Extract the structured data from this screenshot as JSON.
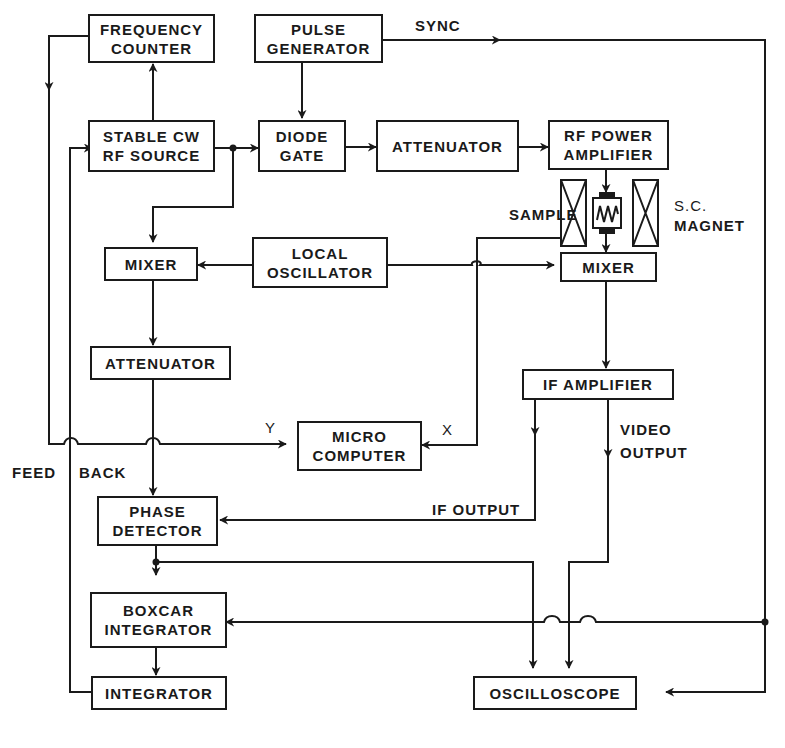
{
  "diagram": {
    "type": "block-diagram",
    "colors": {
      "ink": "#1a1a1a",
      "background": "#ffffff"
    },
    "blocks": {
      "frequency_counter": {
        "line1": "FREQUENCY",
        "line2": "COUNTER"
      },
      "pulse_generator": {
        "line1": "PULSE",
        "line2": "GENERATOR"
      },
      "stable_cw_rf_source": {
        "line1": "STABLE CW",
        "line2": "RF SOURCE"
      },
      "diode_gate": {
        "line1": "DIODE",
        "line2": "GATE"
      },
      "attenuator_top": {
        "line1": "ATTENUATOR"
      },
      "rf_power_amplifier": {
        "line1": "RF POWER",
        "line2": "AMPLIFIER"
      },
      "mixer_left": {
        "line1": "MIXER"
      },
      "local_oscillator": {
        "line1": "LOCAL",
        "line2": "OSCILLATOR"
      },
      "mixer_right": {
        "line1": "MIXER"
      },
      "attenuator_left": {
        "line1": "ATTENUATOR"
      },
      "if_amplifier": {
        "line1": "IF AMPLIFIER"
      },
      "micro_computer": {
        "line1": "MICRO",
        "line2": "COMPUTER"
      },
      "phase_detector": {
        "line1": "PHASE",
        "line2": "DETECTOR"
      },
      "boxcar_integrator": {
        "line1": "BOXCAR",
        "line2": "INTEGRATOR"
      },
      "integrator": {
        "line1": "INTEGRATOR"
      },
      "oscilloscope": {
        "line1": "OSCILLOSCOPE"
      }
    },
    "labels": {
      "sync": "SYNC",
      "sample": "SAMPLE",
      "sc_magnet_line1": "S.C.",
      "sc_magnet_line2": "MAGNET",
      "x": "X",
      "y": "Y",
      "video_output_line1": "VIDEO",
      "video_output_line2": "OUTPUT",
      "if_output": "IF OUTPUT",
      "feed": "FEED",
      "back": "BACK"
    },
    "connections": [
      {
        "from": "Pulse Generator",
        "to": "Diode Gate"
      },
      {
        "from": "Pulse Generator",
        "to": "Boxcar Integrator / Oscilloscope",
        "label": "SYNC"
      },
      {
        "from": "Stable CW RF Source",
        "to": "Frequency Counter"
      },
      {
        "from": "Stable CW RF Source",
        "to": "Diode Gate"
      },
      {
        "from": "Stable CW RF Source",
        "to": "Mixer (left)"
      },
      {
        "from": "Diode Gate",
        "to": "Attenuator"
      },
      {
        "from": "Attenuator",
        "to": "RF Power Amplifier"
      },
      {
        "from": "RF Power Amplifier",
        "to": "Sample"
      },
      {
        "from": "Sample",
        "to": "Mixer (right)"
      },
      {
        "from": "Sample",
        "to": "Micro Computer",
        "label": "X"
      },
      {
        "from": "Local Oscillator",
        "to": "Mixer (left)"
      },
      {
        "from": "Local Oscillator",
        "to": "Mixer (right)"
      },
      {
        "from": "Mixer (left)",
        "to": "Attenuator (left)"
      },
      {
        "from": "Attenuator (left)",
        "to": "Phase Detector"
      },
      {
        "from": "Mixer (right)",
        "to": "IF Amplifier"
      },
      {
        "from": "IF Amplifier",
        "to": "Phase Detector",
        "label": "IF OUTPUT"
      },
      {
        "from": "IF Amplifier",
        "to": "Oscilloscope",
        "label": "VIDEO OUTPUT"
      },
      {
        "from": "Frequency Counter",
        "to": "Micro Computer",
        "label": "Y"
      },
      {
        "from": "Phase Detector",
        "to": "Boxcar Integrator"
      },
      {
        "from": "Phase Detector",
        "to": "Oscilloscope"
      },
      {
        "from": "Boxcar Integrator",
        "to": "Integrator"
      },
      {
        "from": "Integrator",
        "to": "Stable CW RF Source",
        "label": "FEED BACK"
      }
    ]
  }
}
